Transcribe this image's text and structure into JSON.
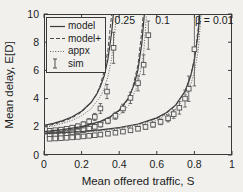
{
  "chart_data": {
    "type": "line",
    "title": "",
    "xlabel": "Mean offered traffic, S",
    "ylabel": "Mean delay, E[D]",
    "xlim": [
      0,
      1
    ],
    "ylim": [
      0,
      10
    ],
    "grid": false,
    "xticks": [
      0,
      0.2,
      0.4,
      0.6,
      0.8,
      1
    ],
    "xtick_labels": [
      "0",
      "0.2",
      "0.4",
      "0.6",
      "0.8",
      "1"
    ],
    "yticks": [
      0,
      2,
      4,
      6,
      8,
      10
    ],
    "ytick_labels": [
      "0",
      "2",
      "4",
      "6",
      "8",
      "10"
    ],
    "legend": {
      "position": "top-left",
      "items": [
        {
          "label": "model",
          "style": "solid"
        },
        {
          "label": "model+",
          "style": "dashed"
        },
        {
          "label": "appx",
          "style": "dotted"
        },
        {
          "label": "sim",
          "style": "errorbar"
        }
      ]
    },
    "annotations": [
      {
        "text": "0.25",
        "x": 0.43,
        "y": 9.55
      },
      {
        "text": "0.1",
        "x": 0.63,
        "y": 9.55
      },
      {
        "text": "β = 0.01",
        "x": 0.905,
        "y": 9.55
      }
    ],
    "colors": {
      "axis": "#3a3a3a",
      "model": "#3a3a3a",
      "model_plus": "#4a4a4a",
      "appx": "#606060",
      "sim": "#4f4f4f",
      "text": "#1c1c1c",
      "background": "#f1f0ed"
    },
    "groups": [
      {
        "beta": 0.25,
        "model": [
          [
            0,
            2.1
          ],
          [
            0.05,
            2.25
          ],
          [
            0.1,
            2.44
          ],
          [
            0.15,
            2.71
          ],
          [
            0.2,
            3.1
          ],
          [
            0.25,
            3.72
          ],
          [
            0.28,
            4.3
          ],
          [
            0.3,
            4.85
          ],
          [
            0.32,
            5.62
          ],
          [
            0.34,
            6.78
          ],
          [
            0.36,
            8.7
          ],
          [
            0.372,
            10.4
          ]
        ],
        "model_plus": [
          [
            0,
            2.03
          ],
          [
            0.05,
            2.17
          ],
          [
            0.1,
            2.37
          ],
          [
            0.15,
            2.64
          ],
          [
            0.2,
            3.04
          ],
          [
            0.25,
            3.69
          ],
          [
            0.28,
            4.34
          ],
          [
            0.3,
            4.97
          ],
          [
            0.32,
            5.97
          ],
          [
            0.34,
            7.42
          ],
          [
            0.355,
            9.34
          ],
          [
            0.366,
            10.6
          ]
        ],
        "appx": [
          [
            0,
            1.95
          ],
          [
            0.05,
            2.07
          ],
          [
            0.1,
            2.24
          ],
          [
            0.15,
            2.46
          ],
          [
            0.2,
            2.78
          ],
          [
            0.25,
            3.27
          ],
          [
            0.3,
            4.14
          ],
          [
            0.32,
            4.72
          ],
          [
            0.34,
            5.54
          ],
          [
            0.36,
            6.87
          ],
          [
            0.38,
            9.17
          ],
          [
            0.388,
            10.5
          ]
        ],
        "sim": [
          [
            0.03,
            1.72,
            0.12
          ],
          [
            0.06,
            1.76,
            0.12
          ],
          [
            0.09,
            1.8,
            0.12
          ],
          [
            0.12,
            1.86,
            0.12
          ],
          [
            0.15,
            1.94,
            0.14
          ],
          [
            0.18,
            2.04,
            0.15
          ],
          [
            0.21,
            2.18,
            0.17
          ],
          [
            0.24,
            2.38,
            0.2
          ],
          [
            0.27,
            2.7,
            0.25
          ],
          [
            0.3,
            3.3,
            0.35
          ],
          [
            0.335,
            4.5,
            0.5
          ],
          [
            0.37,
            7.6,
            1.1
          ]
        ]
      },
      {
        "beta": 0.1,
        "model": [
          [
            0,
            1.66
          ],
          [
            0.1,
            1.8
          ],
          [
            0.2,
            2.01
          ],
          [
            0.3,
            2.38
          ],
          [
            0.35,
            2.69
          ],
          [
            0.4,
            3.18
          ],
          [
            0.45,
            4.05
          ],
          [
            0.48,
            5.0
          ],
          [
            0.5,
            6.06
          ],
          [
            0.52,
            7.9
          ],
          [
            0.537,
            10.5
          ]
        ],
        "model_plus": [
          [
            0,
            1.62
          ],
          [
            0.1,
            1.75
          ],
          [
            0.2,
            1.96
          ],
          [
            0.3,
            2.32
          ],
          [
            0.35,
            2.63
          ],
          [
            0.4,
            3.12
          ],
          [
            0.44,
            3.8
          ],
          [
            0.47,
            4.71
          ],
          [
            0.5,
            6.39
          ],
          [
            0.52,
            8.79
          ],
          [
            0.532,
            10.6
          ]
        ],
        "appx": [
          [
            0,
            1.58
          ],
          [
            0.1,
            1.7
          ],
          [
            0.2,
            1.88
          ],
          [
            0.3,
            2.19
          ],
          [
            0.35,
            2.44
          ],
          [
            0.4,
            2.83
          ],
          [
            0.45,
            3.51
          ],
          [
            0.5,
            4.99
          ],
          [
            0.53,
            7.17
          ],
          [
            0.548,
            10.4
          ]
        ],
        "sim": [
          [
            0.03,
            1.42,
            0.1
          ],
          [
            0.06,
            1.45,
            0.1
          ],
          [
            0.09,
            1.49,
            0.1
          ],
          [
            0.12,
            1.54,
            0.1
          ],
          [
            0.15,
            1.6,
            0.1
          ],
          [
            0.18,
            1.67,
            0.12
          ],
          [
            0.21,
            1.76,
            0.12
          ],
          [
            0.24,
            1.87,
            0.14
          ],
          [
            0.27,
            2.0,
            0.15
          ],
          [
            0.3,
            2.16,
            0.17
          ],
          [
            0.34,
            2.42,
            0.2
          ],
          [
            0.38,
            2.78,
            0.25
          ],
          [
            0.42,
            3.3,
            0.3
          ],
          [
            0.46,
            4.05,
            0.4
          ],
          [
            0.5,
            5.1,
            0.55
          ],
          [
            0.53,
            6.4,
            0.7
          ],
          [
            0.555,
            8.5,
            1.0
          ]
        ]
      },
      {
        "beta": 0.01,
        "model": [
          [
            0,
            1.52
          ],
          [
            0.1,
            1.59
          ],
          [
            0.2,
            1.67
          ],
          [
            0.3,
            1.79
          ],
          [
            0.4,
            1.95
          ],
          [
            0.5,
            2.2
          ],
          [
            0.6,
            2.63
          ],
          [
            0.65,
            2.99
          ],
          [
            0.7,
            3.54
          ],
          [
            0.75,
            4.52
          ],
          [
            0.78,
            5.58
          ],
          [
            0.8,
            6.72
          ],
          [
            0.82,
            8.63
          ],
          [
            0.831,
            10.4
          ]
        ],
        "model_plus": [
          [
            0,
            1.5
          ],
          [
            0.1,
            1.57
          ],
          [
            0.2,
            1.65
          ],
          [
            0.3,
            1.76
          ],
          [
            0.4,
            1.92
          ],
          [
            0.5,
            2.17
          ],
          [
            0.6,
            2.59
          ],
          [
            0.65,
            2.95
          ],
          [
            0.7,
            3.5
          ],
          [
            0.75,
            4.5
          ],
          [
            0.78,
            5.6
          ],
          [
            0.8,
            6.83
          ],
          [
            0.82,
            9.0
          ],
          [
            0.828,
            10.5
          ]
        ],
        "appx": [
          [
            0,
            1.47
          ],
          [
            0.1,
            1.53
          ],
          [
            0.2,
            1.61
          ],
          [
            0.3,
            1.71
          ],
          [
            0.4,
            1.86
          ],
          [
            0.5,
            2.08
          ],
          [
            0.6,
            2.46
          ],
          [
            0.7,
            3.25
          ],
          [
            0.75,
            4.08
          ],
          [
            0.78,
            4.96
          ],
          [
            0.8,
            5.9
          ],
          [
            0.82,
            7.4
          ],
          [
            0.838,
            10.3
          ]
        ],
        "sim": [
          [
            0.03,
            1.15,
            0.08
          ],
          [
            0.06,
            1.17,
            0.08
          ],
          [
            0.09,
            1.19,
            0.08
          ],
          [
            0.12,
            1.22,
            0.08
          ],
          [
            0.15,
            1.25,
            0.08
          ],
          [
            0.18,
            1.28,
            0.09
          ],
          [
            0.21,
            1.32,
            0.09
          ],
          [
            0.24,
            1.36,
            0.09
          ],
          [
            0.27,
            1.4,
            0.1
          ],
          [
            0.3,
            1.45,
            0.1
          ],
          [
            0.34,
            1.51,
            0.1
          ],
          [
            0.38,
            1.58,
            0.11
          ],
          [
            0.42,
            1.66,
            0.12
          ],
          [
            0.46,
            1.75,
            0.13
          ],
          [
            0.5,
            1.86,
            0.14
          ],
          [
            0.54,
            1.99,
            0.15
          ],
          [
            0.58,
            2.15,
            0.17
          ],
          [
            0.62,
            2.35,
            0.2
          ],
          [
            0.66,
            2.6,
            0.25
          ],
          [
            0.69,
            2.9,
            0.3
          ],
          [
            0.72,
            3.35,
            0.45
          ],
          [
            0.75,
            4.0,
            0.6
          ],
          [
            0.77,
            4.7,
            0.9
          ],
          [
            0.8,
            7.5,
            2.6
          ]
        ]
      }
    ]
  }
}
